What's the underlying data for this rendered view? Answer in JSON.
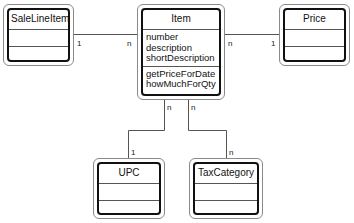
{
  "classes": {
    "sale_line_item": {
      "name": "SaleLineItem",
      "attributes": [],
      "methods": []
    },
    "item": {
      "name": "Item",
      "attributes": [
        "number",
        "description",
        "shortDescription"
      ],
      "methods": [
        "getPriceForDate",
        "howMuchForQty"
      ]
    },
    "price": {
      "name": "Price",
      "attributes": [],
      "methods": []
    },
    "upc": {
      "name": "UPC",
      "attributes": [],
      "methods": []
    },
    "tax_category": {
      "name": "TaxCategory",
      "attributes": [],
      "methods": []
    }
  },
  "associations": [
    {
      "from": "SaleLineItem",
      "to": "Item",
      "from_mult": "1",
      "to_mult": "n"
    },
    {
      "from": "Item",
      "to": "Price",
      "from_mult": "n",
      "to_mult": "1"
    },
    {
      "from": "Item",
      "to": "UPC",
      "from_mult": "n",
      "to_mult": "1"
    },
    {
      "from": "Item",
      "to": "TaxCategory",
      "from_mult": "n",
      "to_mult": "n"
    }
  ]
}
